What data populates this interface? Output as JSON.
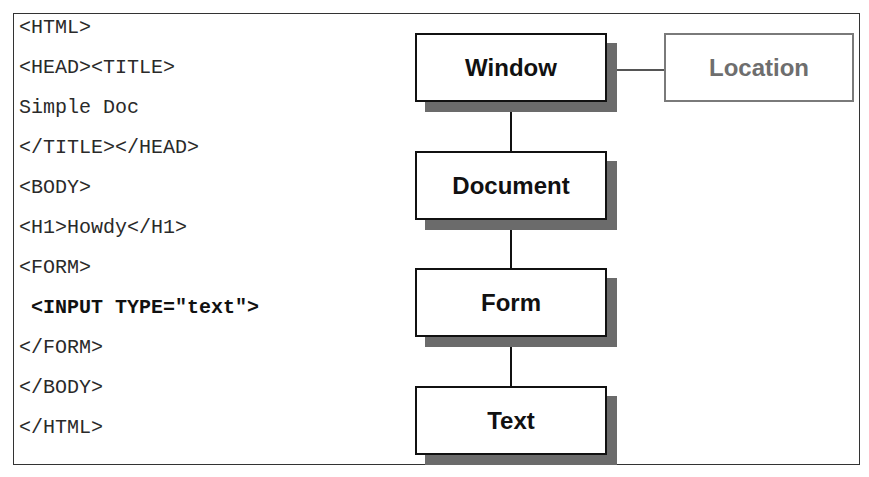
{
  "code_listing": {
    "lines": [
      {
        "text": "<HTML>",
        "bold": false
      },
      {
        "text": "<HEAD><TITLE>",
        "bold": false
      },
      {
        "text": "Simple Doc",
        "bold": false
      },
      {
        "text": "</TITLE></HEAD>",
        "bold": false
      },
      {
        "text": "<BODY>",
        "bold": false
      },
      {
        "text": "<H1>Howdy</H1>",
        "bold": false
      },
      {
        "text": "<FORM>",
        "bold": false
      },
      {
        "text": " <INPUT TYPE=\"text\">",
        "bold": true
      },
      {
        "text": "</FORM>",
        "bold": false
      },
      {
        "text": "</BODY>",
        "bold": false
      },
      {
        "text": "</HTML>",
        "bold": false
      }
    ]
  },
  "diagram": {
    "nodes": {
      "window": "Window",
      "location": "Location",
      "document": "Document",
      "form": "Form",
      "text": "Text"
    },
    "colors": {
      "primary_border": "#111111",
      "secondary_border": "#7a7a7a",
      "shadow": "#6b6b6b"
    }
  }
}
